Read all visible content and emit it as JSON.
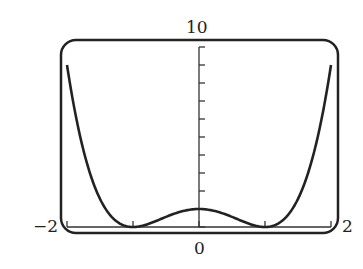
{
  "chart_data": {
    "type": "line",
    "title": "",
    "function": "y = (x^2 - 1)^2",
    "xlabel": "",
    "ylabel": "",
    "xlim": [
      -2,
      2
    ],
    "ylim": [
      0,
      10
    ],
    "x_tick_labels": {
      "min": "−2",
      "center": "0",
      "max": "2"
    },
    "y_tick_labels": {
      "max": "10"
    },
    "x_ticks": [
      -2,
      -1,
      0,
      1,
      2
    ],
    "y_ticks": [
      0,
      1,
      2,
      3,
      4,
      5,
      6,
      7,
      8,
      9,
      10
    ],
    "grid": false,
    "legend": null,
    "series": [
      {
        "name": "f(x)",
        "x": [
          -2.0,
          -1.75,
          -1.5,
          -1.25,
          -1.0,
          -0.75,
          -0.5,
          -0.25,
          0.0,
          0.25,
          0.5,
          0.75,
          1.0,
          1.25,
          1.5,
          1.75,
          2.0
        ],
        "y": [
          9.0,
          4.25,
          1.5625,
          0.316,
          0.0,
          0.191,
          0.5625,
          0.879,
          1.0,
          0.879,
          0.5625,
          0.191,
          0.0,
          0.316,
          1.5625,
          4.25,
          9.0
        ]
      }
    ],
    "colors": {
      "line": "#222222",
      "frame": "#222222",
      "axis": "#333333"
    }
  }
}
